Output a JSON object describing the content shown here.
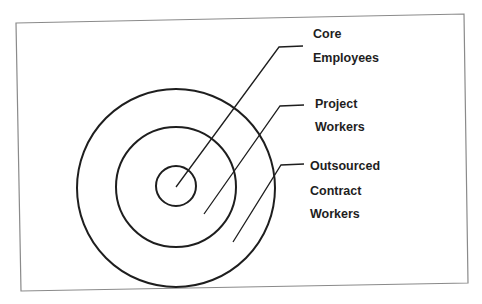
{
  "diagram": {
    "type": "concentric-circles",
    "frame": {
      "stroke": "#8a8a8a"
    },
    "center": [
      176,
      187
    ],
    "rings": [
      {
        "name": "core",
        "radius": 20
      },
      {
        "name": "project",
        "radius": 60
      },
      {
        "name": "outsourced",
        "radius": 100
      }
    ],
    "stroke_color": "#1e1e1e",
    "labels": {
      "core": {
        "line1": "Core",
        "line2": "Employees"
      },
      "project": {
        "line1": "Project",
        "line2": "Workers"
      },
      "outsourced": {
        "line1": "Outsourced",
        "line2": "Contract",
        "line3": "Workers"
      }
    }
  }
}
